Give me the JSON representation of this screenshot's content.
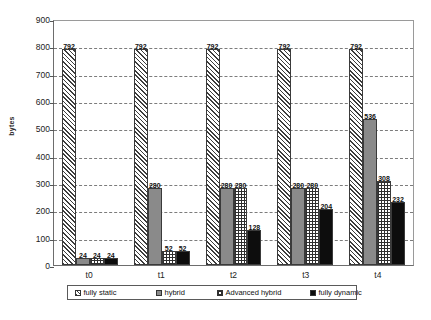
{
  "chart_data": {
    "type": "bar",
    "title": "",
    "subtitle": "",
    "xlabel": "",
    "ylabel": "bytes",
    "categories": [
      "t0",
      "t1",
      "t2",
      "t3",
      "t4"
    ],
    "ylim": [
      0,
      900
    ],
    "yticks": [
      0,
      100,
      200,
      300,
      400,
      500,
      600,
      700,
      800,
      900
    ],
    "ytick_labels": [
      "0",
      "100",
      "200",
      "300",
      "400",
      "500",
      "600",
      "700",
      "800",
      "900"
    ],
    "grid": true,
    "grid_style": "dashed-horizontal",
    "legend_position": "bottom",
    "series": [
      {
        "name": "fully static",
        "pattern": "diagonal-hatch",
        "color": "#3d3d3d",
        "values": [
          792,
          792,
          792,
          792,
          792
        ],
        "labels": [
          "792",
          "792",
          "792",
          "792",
          "792"
        ]
      },
      {
        "name": "hybrid",
        "pattern": "solid-gray",
        "color": "#8a8a8a",
        "values": [
          24,
          280,
          280,
          280,
          536
        ],
        "labels": [
          "24",
          "280",
          "280",
          "280",
          "536"
        ]
      },
      {
        "name": "Advanced hybrid",
        "pattern": "crosshatch-grid",
        "color": "#2f2f2f",
        "values": [
          24,
          52,
          280,
          280,
          308
        ],
        "labels": [
          "24",
          "52",
          "280",
          "280",
          "308"
        ]
      },
      {
        "name": "fully dynamic",
        "pattern": "solid-black",
        "color": "#0d0d0d",
        "values": [
          24,
          52,
          128,
          204,
          232
        ],
        "labels": [
          "24",
          "52",
          "128",
          "204",
          "232"
        ]
      }
    ]
  },
  "axis": {
    "y_title": "bytes"
  },
  "caption": {
    "text": ""
  }
}
